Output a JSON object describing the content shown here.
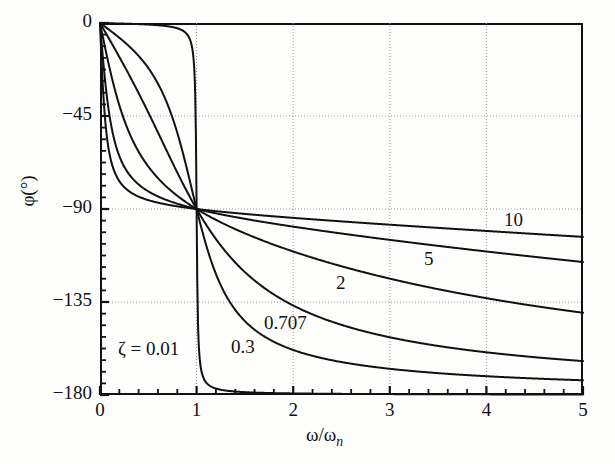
{
  "figure": {
    "kind": "phase-angle-plot",
    "background": "#fdfdfc",
    "ink": "#111111",
    "grid_color": "#9a9a9a"
  },
  "axis": {
    "y_title": "φ(°)",
    "x_title_prefix": "ω/ω",
    "x_title_sub": "n",
    "y_ticks": [
      "0",
      "−45",
      "−90",
      "−135",
      "−180"
    ],
    "x_ticks": [
      "0",
      "1",
      "2",
      "3",
      "4",
      "5"
    ]
  },
  "curve_labels": [
    {
      "id": "zeta-001",
      "text": "ζ = 0.01",
      "x": 118,
      "y": 338
    },
    {
      "id": "zeta-03",
      "text": "0.3",
      "x": 231,
      "y": 336
    },
    {
      "id": "zeta-0707",
      "text": "0.707",
      "x": 264,
      "y": 312
    },
    {
      "id": "zeta-2",
      "text": "2",
      "x": 336,
      "y": 272
    },
    {
      "id": "zeta-5",
      "text": "5",
      "x": 424,
      "y": 248
    },
    {
      "id": "zeta-10",
      "text": "10",
      "x": 504,
      "y": 209
    }
  ],
  "chart_data": {
    "type": "line",
    "title": "",
    "xlabel": "ω/ωn",
    "ylabel": "φ(°)",
    "xlim": [
      0,
      5
    ],
    "ylim": [
      -180,
      0
    ],
    "x_major_ticks": [
      0,
      1,
      2,
      3,
      4,
      5
    ],
    "x_minor_step": 0.2,
    "y_major_ticks": [
      0,
      -45,
      -90,
      -135,
      -180
    ],
    "y_minor_step": 5.625,
    "grid": "dotted-major-both",
    "legend": "inline-curve-labels",
    "formula": "phi = -atan2(2*zeta*r, 1 - r^2) in degrees, r = omega/omega_n",
    "series": [
      {
        "name": "ζ = 0.01",
        "zeta": 0.01,
        "label": "ζ = 0.01",
        "points_r": [
          0,
          0.2,
          0.4,
          0.6,
          0.8,
          0.9,
          0.95,
          0.99,
          1.0,
          1.01,
          1.05,
          1.1,
          1.2,
          1.4,
          1.6,
          2.0,
          2.5,
          3.0,
          4.0,
          5.0
        ],
        "points_phi": [
          0,
          -0.24,
          -0.55,
          -0.69,
          -2.03,
          -6.0,
          -10.9,
          -44.8,
          -90,
          -135.2,
          -169.2,
          -174.3,
          -177.4,
          -179.0,
          -179.4,
          -179.6,
          -179.8,
          -179.9,
          -179.9,
          -180.0
        ]
      },
      {
        "name": "ζ = 0.3",
        "zeta": 0.3,
        "label": "0.3",
        "points_r": [
          0,
          0.2,
          0.4,
          0.6,
          0.8,
          0.9,
          1.0,
          1.1,
          1.2,
          1.4,
          1.6,
          2.0,
          2.5,
          3.0,
          3.5,
          4.0,
          4.5,
          5.0
        ],
        "points_phi": [
          0,
          -7.1,
          -15.9,
          -28.3,
          -48.0,
          -66.7,
          -90,
          -110.9,
          -126.0,
          -143.8,
          -152.6,
          -161.6,
          -166.8,
          -169.8,
          -171.7,
          -173.1,
          -174.1,
          -174.8
        ]
      },
      {
        "name": "ζ = 0.707",
        "zeta": 0.707,
        "label": "0.707",
        "points_r": [
          0,
          0.2,
          0.4,
          0.6,
          0.8,
          1.0,
          1.2,
          1.4,
          1.6,
          2.0,
          2.5,
          3.0,
          3.5,
          4.0,
          4.5,
          5.0
        ],
        "points_phi": [
          0,
          -16.5,
          -34.4,
          -53.9,
          -73.5,
          -90,
          -103.0,
          -112.5,
          -119.4,
          -128.7,
          -135.9,
          -140.5,
          -143.8,
          -146.2,
          -148.1,
          -149.6
        ]
      },
      {
        "name": "ζ = 2",
        "zeta": 2,
        "label": "2",
        "points_r": [
          0,
          0.2,
          0.4,
          0.6,
          0.8,
          1.0,
          1.2,
          1.4,
          1.6,
          2.0,
          2.5,
          3.0,
          3.5,
          4.0,
          4.5,
          5.0
        ],
        "points_phi": [
          0,
          -39.8,
          -59.5,
          -70.3,
          -80.9,
          -90,
          -97.9,
          -104.5,
          -109.9,
          -118.1,
          -125.2,
          -130.2,
          -133.9,
          -136.7,
          -139.0,
          -140.9
        ]
      },
      {
        "name": "ζ = 5",
        "zeta": 5,
        "label": "5",
        "points_r": [
          0,
          0.2,
          0.4,
          0.6,
          0.8,
          1.0,
          1.2,
          1.4,
          1.6,
          2.0,
          2.5,
          3.0,
          3.5,
          4.0,
          4.5,
          5.0
        ],
        "points_phi": [
          0,
          -64.5,
          -76.0,
          -81.2,
          -85.8,
          -90,
          -93.9,
          -97.5,
          -100.7,
          -106.2,
          -111.6,
          -115.9,
          -119.4,
          -122.2,
          -124.6,
          -126.6
        ]
      },
      {
        "name": "ζ = 10",
        "zeta": 10,
        "label": "10",
        "points_r": [
          0,
          0.2,
          0.4,
          0.6,
          0.8,
          1.0,
          1.2,
          1.4,
          1.6,
          2.0,
          2.5,
          3.0,
          3.5,
          4.0,
          4.5,
          5.0
        ],
        "points_phi": [
          0,
          -76.5,
          -83.0,
          -85.6,
          -87.9,
          -90,
          -92.0,
          -93.9,
          -95.7,
          -99.0,
          -102.6,
          -105.8,
          -108.6,
          -111.0,
          -113.2,
          -115.1
        ]
      }
    ]
  }
}
